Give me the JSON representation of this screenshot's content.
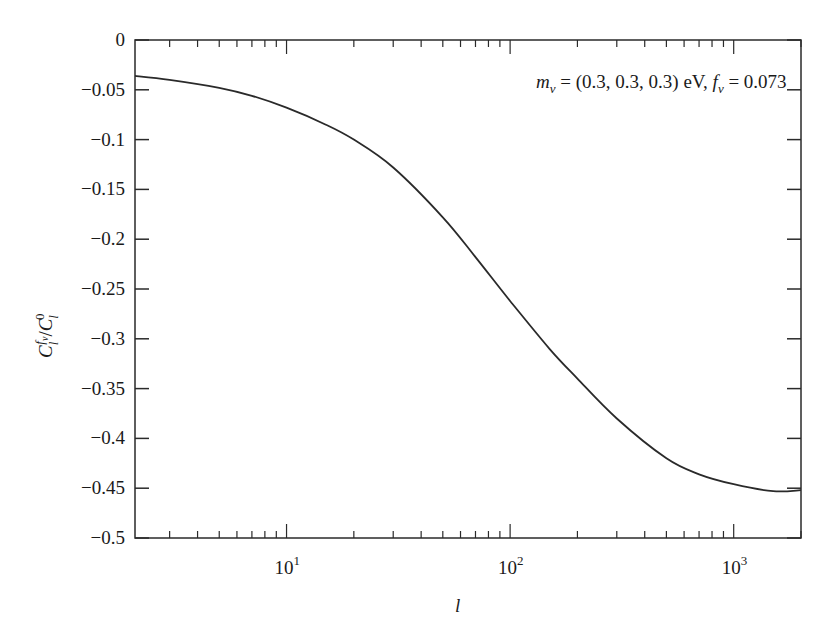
{
  "chart_data": {
    "type": "line",
    "title": "",
    "xlabel": "l",
    "ylabel": "C_l^{f_ν}/C_l^0",
    "xscale": "log",
    "xlim": [
      2.1,
      2000
    ],
    "ylim": [
      -0.5,
      0
    ],
    "grid": false,
    "legend": null,
    "x_ticks": [
      {
        "value": 10,
        "base": "10",
        "exp": "1"
      },
      {
        "value": 100,
        "base": "10",
        "exp": "2"
      },
      {
        "value": 1000,
        "base": "10",
        "exp": "3"
      }
    ],
    "y_ticks": [
      0,
      -0.05,
      -0.1,
      -0.15,
      -0.2,
      -0.25,
      -0.3,
      -0.35,
      -0.4,
      -0.45,
      -0.5
    ],
    "y_tick_labels": [
      "0",
      "−0.05",
      "−0.1",
      "−0.15",
      "−0.2",
      "−0.25",
      "−0.3",
      "−0.35",
      "−0.4",
      "−0.45",
      "−0.5"
    ],
    "annotation": {
      "text": "m_ν = (0.3, 0.3, 0.3) eV, f_ν = 0.073",
      "parts": {
        "m": "m",
        "m_sub": "ν",
        "middle": " = (0.3, 0.3, 0.3) eV, ",
        "f": "f",
        "f_sub": "ν",
        "end": " = 0.073"
      }
    },
    "series": [
      {
        "name": "C_l^{f_ν}/C_l^0",
        "color": "#2a2a2a",
        "x": [
          2.1,
          3,
          5,
          7,
          10,
          15,
          20,
          30,
          50,
          70,
          100,
          150,
          200,
          300,
          500,
          700,
          1000,
          1500,
          2000
        ],
        "y": [
          -0.036,
          -0.04,
          -0.048,
          -0.056,
          -0.068,
          -0.085,
          -0.1,
          -0.128,
          -0.178,
          -0.218,
          -0.262,
          -0.31,
          -0.34,
          -0.38,
          -0.42,
          -0.436,
          -0.446,
          -0.453,
          -0.452
        ]
      }
    ]
  },
  "axis": {
    "ylabel": {
      "C": "C",
      "sub": "l",
      "sup_f": "f",
      "sup_nu": "ν",
      "slash": "/",
      "sub0": "l",
      "sup0": "0"
    },
    "xlabel": "l"
  }
}
